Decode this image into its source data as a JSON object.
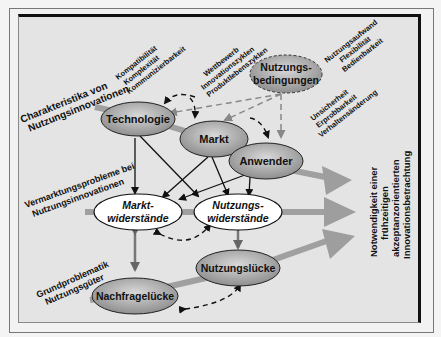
{
  "diagram": {
    "nodes": {
      "technologie": "Technologie",
      "markt": "Markt",
      "anwender": "Anwender",
      "nutzungsbedingungen_1": "Nutzungs-",
      "nutzungsbedingungen_2": "bedingungen",
      "marktwiderstaende_1": "Markt-",
      "marktwiderstaende_2": "widerstände",
      "nutzungswiderstaende_1": "Nutzungs-",
      "nutzungswiderstaende_2": "widerstände",
      "nutzungsluecke": "Nutzungslücke",
      "nachfrageluecke": "Nachfragelücke"
    },
    "side_labels": {
      "charakteristika_1": "Charakteristika von",
      "charakteristika_2": "Nutzungsinnovationen",
      "vermarktung_1": "Vermarktungsprobleme bei",
      "vermarktung_2": "Nutzungsinnovationen",
      "grundproblematik_1": "Grundproblematik",
      "grundproblematik_2": "Nutzungsgüter"
    },
    "attributes": {
      "technologie": [
        "Kompatibilität",
        "Komplexität",
        "Kommunizierbarkeit"
      ],
      "markt": [
        "Wettbewerb",
        "Innovationszyklen",
        "Produktlebenszyklen"
      ],
      "nutzungsbedingungen": [
        "Nutzungsaufwand",
        "Flexibilität",
        "Bedienbarkeit"
      ],
      "anwender": [
        "Unsicherheit",
        "Erprobbarkeit",
        "Verhaltensänderung"
      ]
    },
    "conclusion": [
      "Notwendigkeit einer",
      "frühzeitigen",
      "akzeptanzorientierten",
      "Innovationsbetrachtung"
    ],
    "colors": {
      "ellipse_gray": "#a9a9a9",
      "ellipse_white": "#ffffff",
      "band_gray": "#9a9a9a",
      "panel_bg": "#e4e4e4"
    }
  }
}
